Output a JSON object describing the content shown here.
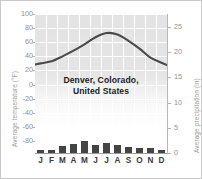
{
  "chart_data": {
    "type": "line",
    "title": "Denver, Colorado, United States",
    "title_line1": "Denver, Colorado,",
    "title_line2": "United States",
    "categories": [
      "J",
      "F",
      "M",
      "A",
      "M",
      "J",
      "J",
      "A",
      "S",
      "O",
      "N",
      "D"
    ],
    "month_names": [
      "January",
      "February",
      "March",
      "April",
      "May",
      "June",
      "July",
      "August",
      "September",
      "October",
      "November",
      "December"
    ],
    "grid": true,
    "legend": "none",
    "series": [
      {
        "name": "Average temperature",
        "type": "line",
        "axis": "left",
        "unit": "°F",
        "values": [
          30,
          33,
          40,
          48,
          57,
          67,
          73,
          71,
          62,
          51,
          38,
          31
        ],
        "color": "#4a4a4a"
      },
      {
        "name": "Average precipitation",
        "type": "bar",
        "axis": "right",
        "unit": "in",
        "values": [
          0.5,
          0.6,
          1.3,
          1.7,
          2.3,
          1.6,
          1.9,
          1.6,
          1.1,
          1.0,
          0.9,
          0.6
        ],
        "color": "#444444"
      }
    ],
    "left_axis": {
      "label": "Average temperature (°F)",
      "ticks": [
        100,
        80,
        60,
        40,
        20,
        0,
        -20,
        -40,
        -60,
        -80
      ],
      "ylim": [
        -90,
        100
      ],
      "unit": "°F"
    },
    "right_axis": {
      "label": "Average precipitation (in)",
      "ticks": [
        25,
        20,
        15,
        10,
        5,
        0
      ],
      "ylim": [
        0,
        28
      ],
      "unit": "in"
    },
    "xlabel": "",
    "ylabel": "Average temperature (°F)"
  },
  "colors": {
    "plot_background": "#e3e3e3",
    "gridline": "#ffffff",
    "line": "#4a4a4a",
    "bar": "#444444",
    "tick_text": "#8f8f8f",
    "axis_title": "#9a9a9a",
    "annotation_text": "#1d1d1d",
    "frame_border": "#c9c9c9"
  }
}
